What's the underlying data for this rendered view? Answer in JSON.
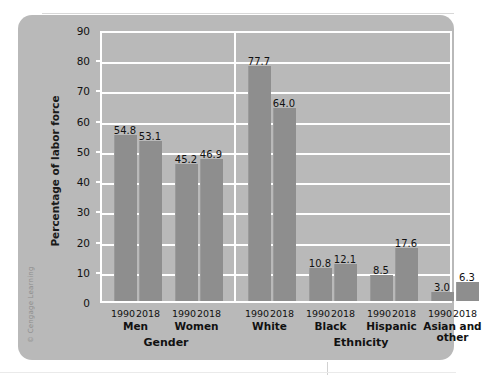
{
  "figure": {
    "credit": "© Cengage Learning",
    "top_strip_text": "· · · · · ·"
  },
  "chart_data": {
    "type": "bar",
    "title": "",
    "xlabel": "",
    "ylabel": "Percentage of labor force",
    "ylim": [
      0,
      90
    ],
    "ytick_step": 10,
    "yticks": [
      "0",
      "10",
      "20",
      "30",
      "40",
      "50",
      "60",
      "70",
      "80",
      "90"
    ],
    "grid": true,
    "legend": "none",
    "sections": [
      {
        "name": "Gender",
        "groups": [
          {
            "name": "Men",
            "categories": [
              "1990",
              "2018"
            ],
            "values": [
              54.8,
              53.1
            ]
          },
          {
            "name": "Women",
            "categories": [
              "1990",
              "2018"
            ],
            "values": [
              45.2,
              46.9
            ]
          }
        ]
      },
      {
        "name": "Ethnicity",
        "groups": [
          {
            "name": "White",
            "categories": [
              "1990",
              "2018"
            ],
            "values": [
              77.7,
              64.0
            ]
          },
          {
            "name": "Black",
            "categories": [
              "1990",
              "2018"
            ],
            "values": [
              10.8,
              12.1
            ]
          },
          {
            "name": "Hispanic",
            "categories": [
              "1990",
              "2018"
            ],
            "values": [
              8.5,
              17.6
            ]
          },
          {
            "name": "Asian and other",
            "categories": [
              "1990",
              "2018"
            ],
            "values": [
              3.0,
              6.3
            ]
          }
        ]
      }
    ],
    "colors": {
      "bar": "#8e8e8e",
      "panel": "#b9b9b9",
      "grid": "#ffffff",
      "text": "#111111"
    }
  }
}
